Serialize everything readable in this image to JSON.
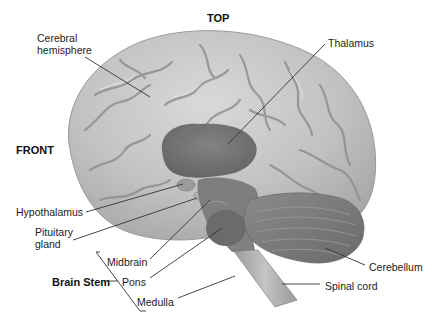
{
  "figure": {
    "orientation_labels": {
      "top": "TOP",
      "front": "FRONT"
    },
    "structures": [
      {
        "id": "cerebral-hemisphere",
        "label_line1": "Cerebral",
        "label_line2": "hemisphere"
      },
      {
        "id": "thalamus",
        "label": "Thalamus"
      },
      {
        "id": "hypothalamus",
        "label": "Hypothalamus"
      },
      {
        "id": "pituitary-gland",
        "label_line1": "Pituitary",
        "label_line2": "gland"
      },
      {
        "id": "midbrain",
        "label": "Midbrain"
      },
      {
        "id": "pons",
        "label": "Pons"
      },
      {
        "id": "medulla",
        "label": "Medulla"
      },
      {
        "id": "cerebellum",
        "label": "Cerebellum"
      },
      {
        "id": "spinal-cord",
        "label": "Spinal cord"
      }
    ],
    "groups": [
      {
        "id": "brain-stem",
        "label": "Brain Stem",
        "members": [
          "Midbrain",
          "Pons",
          "Medulla"
        ]
      }
    ],
    "colors": {
      "cerebrum": "#bdbdbd",
      "cerebrum_highlight": "#d6d6d6",
      "sulci": "#8e8e8e",
      "deep_structures": "#6e6e6e",
      "cerebellum": "#7a7a7a",
      "spinal_cord": "#a9a9a9",
      "leader_lines": "#333333"
    }
  }
}
